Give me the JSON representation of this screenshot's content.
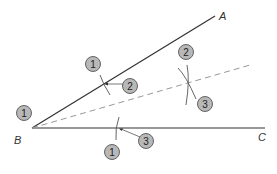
{
  "diagram": {
    "colors": {
      "line": "#333333",
      "bisector": "#999999",
      "arc": "#555555",
      "step_fill": "#b8b8b8",
      "step_stroke": "#555555"
    },
    "vertices": {
      "A": {
        "label": "A",
        "x": 215,
        "y": 16,
        "label_x": 219,
        "label_y": 20
      },
      "B": {
        "label": "B",
        "x": 32,
        "y": 128,
        "label_x": 14,
        "label_y": 144
      },
      "C": {
        "label": "C",
        "x": 265,
        "y": 128,
        "label_x": 258,
        "label_y": 141
      }
    },
    "bisector": {
      "x1": 32,
      "y1": 128,
      "x2": 250,
      "y2": 65,
      "style": "dashed"
    },
    "step_markers": [
      {
        "label": "1",
        "x": 24,
        "y": 113
      },
      {
        "label": "1",
        "x": 93,
        "y": 64
      },
      {
        "label": "2",
        "x": 130,
        "y": 86
      },
      {
        "label": "2",
        "x": 186,
        "y": 52
      },
      {
        "label": "3",
        "x": 205,
        "y": 104
      },
      {
        "label": "1",
        "x": 112,
        "y": 152
      },
      {
        "label": "3",
        "x": 146,
        "y": 141
      }
    ]
  }
}
